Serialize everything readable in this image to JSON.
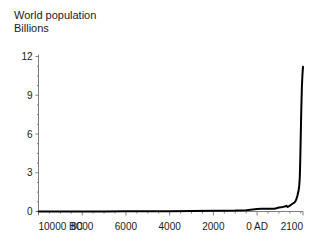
{
  "chart_data": {
    "type": "line",
    "title": "World population",
    "subtitle": "Billions",
    "xlabel": "",
    "ylabel": "Billions",
    "grid": false,
    "legend": false,
    "line_color": "#000000",
    "axis_color": "#808080",
    "background": "#ffffff",
    "xlim": [
      -10000,
      2100
    ],
    "ylim": [
      0,
      12
    ],
    "x_tick_labels": [
      "10000 BC",
      "8000",
      "6000",
      "4000",
      "2000",
      "0 AD",
      "2100"
    ],
    "x_tick_values": [
      -10000,
      -8000,
      -6000,
      -4000,
      -2000,
      0,
      2100
    ],
    "y_tick_labels": [
      "0",
      "3",
      "6",
      "9",
      "12"
    ],
    "y_tick_values": [
      0,
      3,
      6,
      9,
      12
    ],
    "y_minor_step": 0.75,
    "series_name": "World population",
    "x": [
      -10000,
      -9000,
      -8000,
      -7000,
      -6000,
      -5000,
      -4000,
      -3000,
      -2000,
      -1000,
      -500,
      0,
      200,
      400,
      600,
      800,
      1000,
      1100,
      1200,
      1300,
      1340,
      1400,
      1500,
      1600,
      1700,
      1750,
      1800,
      1850,
      1900,
      1927,
      1950,
      1960,
      1974,
      1987,
      1999,
      2011,
      2023,
      2050,
      2075,
      2100
    ],
    "values": [
      0.004,
      0.005,
      0.005,
      0.007,
      0.01,
      0.015,
      0.02,
      0.03,
      0.05,
      0.07,
      0.1,
      0.19,
      0.21,
      0.21,
      0.21,
      0.22,
      0.31,
      0.32,
      0.36,
      0.4,
      0.44,
      0.35,
      0.46,
      0.58,
      0.68,
      0.79,
      0.98,
      1.26,
      1.65,
      2.0,
      2.54,
      3.03,
      4.0,
      5.0,
      6.0,
      7.0,
      8.0,
      9.7,
      10.6,
      11.2
    ]
  }
}
